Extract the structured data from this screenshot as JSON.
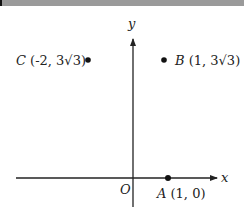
{
  "axes": {
    "x_label": "x",
    "y_label": "y",
    "origin_label": "O"
  },
  "points": [
    {
      "name": "A",
      "coords": "(1, 0)"
    },
    {
      "name": "B",
      "coords": "(1, 3√3)"
    },
    {
      "name": "C",
      "coords": "(-2, 3√3)"
    }
  ],
  "colors": {
    "stroke": "#222222",
    "topbar": "#9a9a9a"
  }
}
